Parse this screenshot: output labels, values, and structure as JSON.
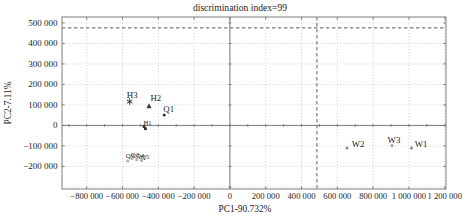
{
  "chart_data": {
    "type": "scatter",
    "title": "discrimination index=99",
    "xlabel": "PC1-90.732%",
    "ylabel": "PC2-7.11%",
    "xlim": [
      -938000,
      1207000
    ],
    "ylim": [
      -310000,
      529000
    ],
    "grid": {
      "show": true,
      "x_interval": 200000,
      "y_interval": 100000,
      "style": "dotted"
    },
    "x_ticks": [
      {
        "value": -800000,
        "label": "−800 000"
      },
      {
        "value": -600000,
        "label": "−600 000"
      },
      {
        "value": -400000,
        "label": "−400 000"
      },
      {
        "value": -200000,
        "label": "−200 000"
      },
      {
        "value": 0,
        "label": "0"
      },
      {
        "value": 200000,
        "label": "200 000"
      },
      {
        "value": 400000,
        "label": "400 000"
      },
      {
        "value": 600000,
        "label": "600 000"
      },
      {
        "value": 800000,
        "label": "800 000"
      },
      {
        "value": 1000000,
        "label": "1 000 000"
      },
      {
        "value": 1200000,
        "label": "1 200 000"
      }
    ],
    "y_ticks": [
      {
        "value": 500000,
        "label": "500 000"
      },
      {
        "value": 400000,
        "label": "400 000"
      },
      {
        "value": 300000,
        "label": "300 000"
      },
      {
        "value": 200000,
        "label": "200 000"
      },
      {
        "value": 100000,
        "label": "100 000"
      },
      {
        "value": 0,
        "label": "0"
      },
      {
        "value": -100000,
        "label": "−100 000"
      },
      {
        "value": -200000,
        "label": "−200 000"
      }
    ],
    "axis_lines": {
      "x_zero": true,
      "y_zero": true,
      "minor_tick_interval": 100000
    },
    "reference_lines": [
      {
        "axis": "y",
        "value": 476000,
        "style": "dashed"
      },
      {
        "axis": "x",
        "value": 486000,
        "style": "dashed"
      }
    ],
    "points": [
      {
        "label": "H3",
        "x": -560000,
        "y": 116000,
        "marker": "asterisk",
        "color": "#3a3a3a",
        "label_color": "#1f1f1f",
        "label_size": 8.8,
        "label_dx": 2.5,
        "label_dy": -3.2
      },
      {
        "label": "H2",
        "x": -452000,
        "y": 95000,
        "marker": "triangle",
        "color": "#3a3a3a",
        "label_color": "#1f1f1f",
        "label_size": 8.8,
        "label_dx": 6.8,
        "label_dy": -5.3
      },
      {
        "label": "Q1",
        "x": -367000,
        "y": 51000,
        "marker": "circle",
        "color": "#3a3a3a",
        "label_color": "#1f1f1f",
        "label_size": 8.8,
        "label_dx": 4.5,
        "label_dy": -2.7
      },
      {
        "label": "H1",
        "x": -480000,
        "y": -5000,
        "marker": "square",
        "color": "#2e2e2e",
        "label_color": "#4a4a4a",
        "label_size": 6.5,
        "label_dx": 3.5,
        "label_dy": -1
      },
      {
        "label": "",
        "x": -472000,
        "y": -16000,
        "marker": "square",
        "color": "#2e2e2e",
        "label_color": "#4a4a4a",
        "label_size": 6.5,
        "label_dx": 0,
        "label_dy": 0
      },
      {
        "label": "Q2",
        "x": -571000,
        "y": -173000,
        "marker": "circle",
        "color": "#b2b2b2",
        "label_color": "#bcbcbc",
        "label_size": 6.8,
        "label_dx": 2.2,
        "label_dy": -3
      },
      {
        "label": "Q3",
        "x": -548000,
        "y": -161000,
        "marker": "circle",
        "color": "#b2b2b2",
        "label_color": "#bcbcbc",
        "label_size": 6.8,
        "label_dx": 3.2,
        "label_dy": -1
      },
      {
        "label": "Q4",
        "x": -521000,
        "y": -167000,
        "marker": "circle",
        "color": "#b2b2b2",
        "label_color": "#bcbcbc",
        "label_size": 6.8,
        "label_dx": 3.4,
        "label_dy": -1.7
      },
      {
        "label": "Q5",
        "x": -494000,
        "y": -171000,
        "marker": "circle",
        "color": "#b2b2b2",
        "label_color": "#bcbcbc",
        "label_size": 6.8,
        "label_dx": 3.5,
        "label_dy": -2
      },
      {
        "label": "W2",
        "x": 654000,
        "y": -110000,
        "marker": "circle",
        "color": "#8f8f8f",
        "label_color": "#383838",
        "label_size": 8.8,
        "label_dx": 11,
        "label_dy": -1.3
      },
      {
        "label": "W3",
        "x": 905000,
        "y": -98000,
        "marker": "circle",
        "color": "#a5a5a5",
        "label_color": "#383838",
        "label_size": 8.8,
        "label_dx": 2,
        "label_dy": -2.6
      },
      {
        "label": "W1",
        "x": 1015000,
        "y": -110000,
        "marker": "circle",
        "color": "#8f8f8f",
        "label_color": "#383838",
        "label_size": 8.8,
        "label_dx": 9.5,
        "label_dy": -1
      }
    ],
    "colors": {
      "background": "#ffffff",
      "grid": "#cdcdcd",
      "frame": "#7d7d7d",
      "axis": "#7d7d7d",
      "dashed_line": "#5f5f5f",
      "text": "#1c1c1c"
    }
  }
}
